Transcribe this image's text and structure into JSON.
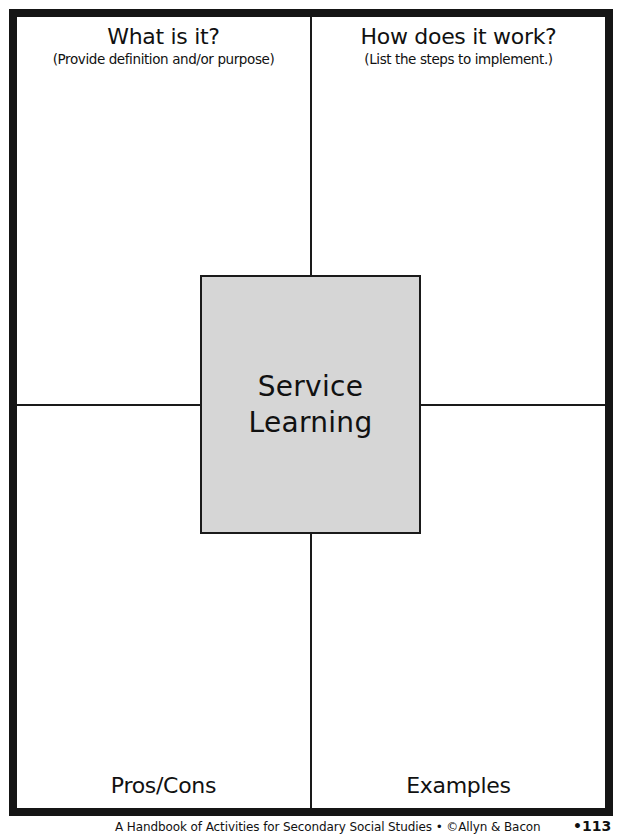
{
  "organizer": {
    "center_term": [
      "Service",
      "Learning"
    ],
    "quadrants": {
      "top_left": {
        "title": "What is it?",
        "subtitle": "(Provide definition and/or purpose)"
      },
      "top_right": {
        "title": "How does it work?",
        "subtitle": "(List the steps to implement.)"
      },
      "bottom_left": {
        "title": "Pros/Cons"
      },
      "bottom_right": {
        "title": "Examples"
      }
    },
    "colors": {
      "border": "#151515",
      "center_fill": "#d6d6d6"
    }
  },
  "footer": {
    "citation": "A Handbook of Activities for Secondary Social Studies • ©Allyn & Bacon",
    "page_number": "•113"
  }
}
